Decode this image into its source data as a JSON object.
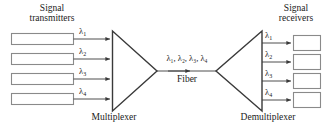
{
  "diagram": {
    "colors": {
      "stroke": "#3a3a3a",
      "box_stroke": "#8a8a8a",
      "text": "#1a1a1a",
      "background": "#ffffff"
    },
    "left_caption": {
      "line1": "Signal",
      "line2": "transmitters"
    },
    "right_caption": {
      "line1": "Signal",
      "line2": "receivers"
    },
    "multiplexer_label": "Multiplexer",
    "demultiplexer_label": "Demultiplexer",
    "fiber": {
      "wavelengths_label": "λ₁, λ₂, λ₃, λ₄",
      "name_label": "Fiber"
    },
    "transmitters": [
      {
        "id": "tx-1",
        "wavelength": "λ",
        "subscript": "1"
      },
      {
        "id": "tx-2",
        "wavelength": "λ",
        "subscript": "2"
      },
      {
        "id": "tx-3",
        "wavelength": "λ",
        "subscript": "3"
      },
      {
        "id": "tx-4",
        "wavelength": "λ",
        "subscript": "4"
      }
    ],
    "receivers": [
      {
        "id": "rx-1",
        "wavelength": "λ",
        "subscript": "1"
      },
      {
        "id": "rx-2",
        "wavelength": "λ",
        "subscript": "2"
      },
      {
        "id": "rx-3",
        "wavelength": "λ",
        "subscript": "3"
      },
      {
        "id": "rx-4",
        "wavelength": "λ",
        "subscript": "4"
      }
    ]
  }
}
